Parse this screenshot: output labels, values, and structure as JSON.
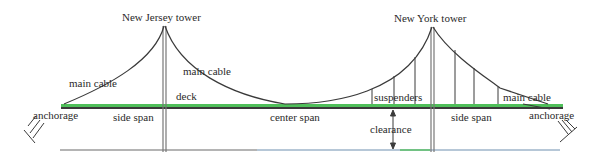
{
  "diagram": {
    "labels": {
      "nj_tower": "New Jersey tower",
      "ny_tower": "New York tower",
      "main_cable_left": "main cable",
      "main_cable_center": "main cable",
      "main_cable_right": "main cable",
      "anchorage_left": "anchorage",
      "anchorage_right": "anchorage",
      "deck": "deck",
      "side_span_left": "side span",
      "side_span_right": "side span",
      "center_span": "center span",
      "suspenders": "suspenders",
      "clearance": "clearance"
    },
    "colors": {
      "deck_top": "#4fbf5a",
      "deck_bottom": "#3a3a3a",
      "cable": "#3a3a3a",
      "tower": "#6a6a6a",
      "water": "#7a7ab0",
      "text": "#2a2a2a"
    }
  }
}
